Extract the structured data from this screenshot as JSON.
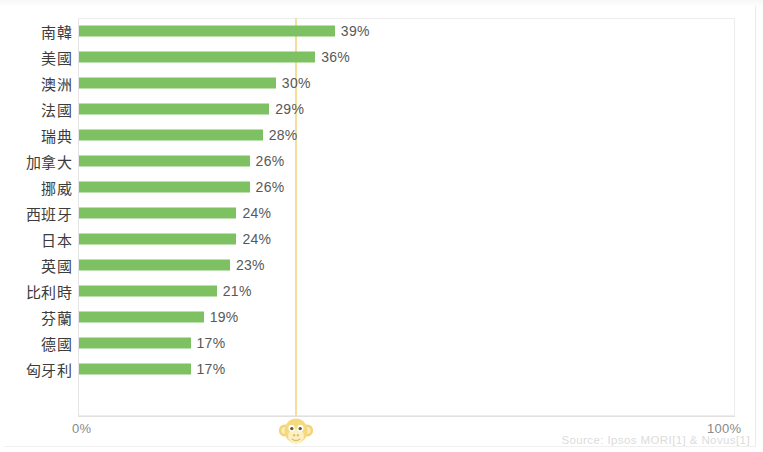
{
  "chart_data": {
    "type": "bar",
    "orientation": "horizontal",
    "categories": [
      "南韓",
      "美國",
      "澳洲",
      "法國",
      "瑞典",
      "加拿大",
      "挪威",
      "西班牙",
      "日本",
      "英國",
      "比利時",
      "芬蘭",
      "德國",
      "匈牙利"
    ],
    "values": [
      39,
      36,
      30,
      29,
      28,
      26,
      26,
      24,
      24,
      23,
      21,
      19,
      17,
      17
    ],
    "value_labels": [
      "39%",
      "36%",
      "30%",
      "29%",
      "28%",
      "26%",
      "26%",
      "24%",
      "24%",
      "23%",
      "21%",
      "19%",
      "17%",
      "17%"
    ],
    "title": "",
    "xlabel": "",
    "ylabel": "",
    "xlim": [
      0,
      100
    ],
    "xticks": [
      0,
      100
    ],
    "xtick_labels": [
      "0%",
      "100%"
    ],
    "grid": false,
    "legend": "none",
    "bar_color": "#7dc163",
    "annotations": [
      {
        "name": "reference-line",
        "type": "vertical-line",
        "value": 33,
        "color": "#f6dd9a"
      }
    ]
  },
  "axis": {
    "min_label": "0%",
    "max_label": "100%"
  },
  "footer": {
    "source": "Source: Ipsos MORI[1] & Novus[1]"
  },
  "branding": {
    "logo_icon": "monkey-face-icon",
    "logo_color": "#f5d97e"
  }
}
